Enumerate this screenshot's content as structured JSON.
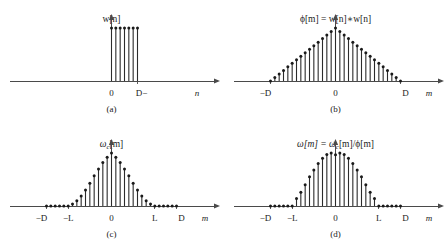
{
  "figure": {
    "background_color": "#ffffff",
    "stem_color": "#2b2b2b",
    "axis_color": "#4a4a4a",
    "width": 447,
    "height": 250
  },
  "panels": [
    {
      "id": "a",
      "caption": "(a)",
      "title_main": "w[n]",
      "title_sub": "",
      "title_tail": "",
      "xlabel": "n",
      "ticks": [
        {
          "label": "0",
          "x": 0
        },
        {
          "label": "D−",
          "x": 6
        }
      ],
      "chart_data": {
        "type": "stem",
        "title": "w[n]",
        "xlabel": "n",
        "ylabel": "",
        "x": [
          0,
          1,
          2,
          3,
          4,
          5,
          6
        ],
        "values": [
          1,
          1,
          1,
          1,
          1,
          1,
          1
        ],
        "xlim": [
          -14,
          14
        ],
        "ylim": [
          0,
          1.15
        ],
        "grid": false,
        "description": "Rectangular window of length D, unit amplitude samples from n=0 to n=D-1"
      }
    },
    {
      "id": "b",
      "caption": "(b)",
      "title_main": "ϕ[m] = w[n]∗w[n]",
      "title_sub": "",
      "title_tail": "",
      "xlabel": "m",
      "ticks": [
        {
          "label": "−D",
          "x": -15
        },
        {
          "label": "0",
          "x": 0
        },
        {
          "label": "D",
          "x": 15
        }
      ],
      "chart_data": {
        "type": "stem",
        "title": "ϕ[m] = w[n]∗w[n]",
        "xlabel": "m",
        "ylabel": "",
        "x": [
          -15,
          -14,
          -13,
          -12,
          -11,
          -10,
          -9,
          -8,
          -7,
          -6,
          -5,
          -4,
          -3,
          -2,
          -1,
          0,
          1,
          2,
          3,
          4,
          5,
          6,
          7,
          8,
          9,
          10,
          11,
          12,
          13,
          14,
          15
        ],
        "values": [
          0.0,
          0.067,
          0.133,
          0.2,
          0.267,
          0.333,
          0.4,
          0.467,
          0.533,
          0.6,
          0.667,
          0.733,
          0.8,
          0.867,
          0.933,
          1.0,
          0.933,
          0.867,
          0.8,
          0.733,
          0.667,
          0.6,
          0.533,
          0.467,
          0.4,
          0.333,
          0.267,
          0.2,
          0.133,
          0.067,
          0.0
        ],
        "xlim": [
          -19,
          19
        ],
        "ylim": [
          0,
          1.15
        ],
        "grid": false,
        "description": "Triangular autocorrelation of rectangular window, support -D to D, peak at m=0"
      }
    },
    {
      "id": "c",
      "caption": "(c)",
      "title_main": "ω",
      "title_sub": "c",
      "title_tail": "[m]",
      "xlabel": "m",
      "ticks": [
        {
          "label": "−D",
          "x": -15
        },
        {
          "label": "−L",
          "x": -10
        },
        {
          "label": "0",
          "x": 0
        },
        {
          "label": "L",
          "x": 10
        },
        {
          "label": "D",
          "x": 15
        }
      ],
      "chart_data": {
        "type": "stem",
        "title": "ω_c[m]",
        "xlabel": "m",
        "ylabel": "",
        "x": [
          -15,
          -14,
          -13,
          -12,
          -11,
          -10,
          -9,
          -8,
          -7,
          -6,
          -5,
          -4,
          -3,
          -2,
          -1,
          0,
          1,
          2,
          3,
          4,
          5,
          6,
          7,
          8,
          9,
          10,
          11,
          12,
          13,
          14,
          15
        ],
        "values": [
          0.0,
          0.0,
          0.0,
          0.0,
          0.0,
          0.0,
          0.04,
          0.1,
          0.19,
          0.3,
          0.43,
          0.57,
          0.7,
          0.82,
          0.92,
          1.0,
          0.92,
          0.82,
          0.7,
          0.57,
          0.43,
          0.3,
          0.19,
          0.1,
          0.04,
          0.0,
          0.0,
          0.0,
          0.0,
          0.0,
          0.0
        ],
        "xlim": [
          -19,
          19
        ],
        "ylim": [
          0,
          1.15
        ],
        "grid": false,
        "description": "Bell-shaped correlation window supported on -L to L, zero outside, peak at m=0"
      }
    },
    {
      "id": "d",
      "caption": "(d)",
      "title_main": "ω[m] = ω",
      "title_sub": "c",
      "title_tail": "[m]/ϕ[m]",
      "xlabel": "m",
      "ticks": [
        {
          "label": "−D",
          "x": -15
        },
        {
          "label": "−L",
          "x": -10
        },
        {
          "label": "0",
          "x": 0
        },
        {
          "label": "L",
          "x": 10
        },
        {
          "label": "D",
          "x": 15
        }
      ],
      "chart_data": {
        "type": "stem",
        "title": "ω[m] = ω_c[m]/ϕ[m]",
        "xlabel": "m",
        "ylabel": "",
        "x": [
          -15,
          -14,
          -13,
          -12,
          -11,
          -10,
          -9,
          -8,
          -7,
          -6,
          -5,
          -4,
          -3,
          -2,
          -1,
          0,
          1,
          2,
          3,
          4,
          5,
          6,
          7,
          8,
          9,
          10,
          11,
          12,
          13,
          14,
          15
        ],
        "values": [
          0.0,
          0.0,
          0.0,
          0.0,
          0.0,
          0.0,
          0.14,
          0.26,
          0.4,
          0.55,
          0.68,
          0.8,
          0.9,
          0.97,
          1.0,
          0.965,
          1.0,
          0.97,
          0.9,
          0.8,
          0.68,
          0.55,
          0.4,
          0.26,
          0.14,
          0.0,
          0.0,
          0.0,
          0.0,
          0.0,
          0.0
        ],
        "xlim": [
          -19,
          19
        ],
        "ylim": [
          0,
          1.15
        ],
        "grid": false,
        "description": "Normalized window, ratio of correlation window to triangular autocorrelation; flattened dome with slight dip at center"
      }
    }
  ]
}
